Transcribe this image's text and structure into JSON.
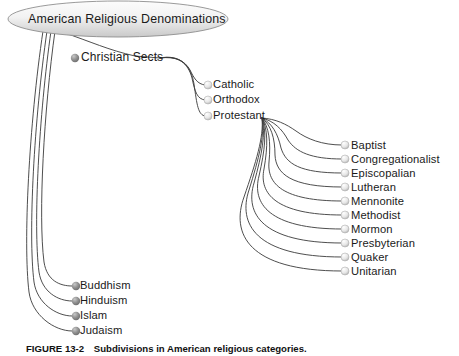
{
  "figure": {
    "root": {
      "label": "American Religious Denominations",
      "shape": "ellipse",
      "fill_light": "#f7f7f7",
      "fill_dark": "#d2d2d2",
      "stroke": "#8c8c8c"
    },
    "colors": {
      "background": "#ffffff",
      "connector": "#3a3a3a",
      "text": "#1a1a1a",
      "bullet_dark": "#8a8a8a",
      "bullet_light": "#d9d9d9"
    },
    "branches": [
      {
        "label": "Christian Sects",
        "bullet": "dark",
        "x": 78,
        "y": 58,
        "children": [
          {
            "label": "Catholic",
            "bullet": "light",
            "x": 212,
            "y": 85
          },
          {
            "label": "Orthodox",
            "bullet": "light",
            "x": 212,
            "y": 100
          },
          {
            "label": "Protestant",
            "bullet": "light",
            "x": 212,
            "y": 116
          }
        ]
      },
      {
        "label": "Buddhism",
        "bullet": "dark",
        "x": 80,
        "y": 285
      },
      {
        "label": "Hinduism",
        "bullet": "dark",
        "x": 80,
        "y": 300
      },
      {
        "label": "Islam",
        "bullet": "dark",
        "x": 80,
        "y": 315
      },
      {
        "label": "Judaism",
        "bullet": "dark",
        "x": 80,
        "y": 330
      }
    ],
    "protestant_children": [
      {
        "label": "Baptist",
        "bullet": "light",
        "x": 349,
        "y": 145
      },
      {
        "label": "Congregationalist",
        "bullet": "light",
        "x": 349,
        "y": 159
      },
      {
        "label": "Episcopalian",
        "bullet": "light",
        "x": 349,
        "y": 173
      },
      {
        "label": "Lutheran",
        "bullet": "light",
        "x": 349,
        "y": 187
      },
      {
        "label": "Mennonite",
        "bullet": "light",
        "x": 349,
        "y": 201
      },
      {
        "label": "Methodist",
        "bullet": "light",
        "x": 349,
        "y": 215
      },
      {
        "label": "Mormon",
        "bullet": "light",
        "x": 349,
        "y": 229
      },
      {
        "label": "Presbyterian",
        "bullet": "light",
        "x": 349,
        "y": 243
      },
      {
        "label": "Quaker",
        "bullet": "light",
        "x": 349,
        "y": 257
      },
      {
        "label": "Unitarian",
        "bullet": "light",
        "x": 349,
        "y": 271
      }
    ],
    "caption": {
      "number": "FIGURE 13-2",
      "text": "Subdivisions in American religious categories."
    }
  }
}
